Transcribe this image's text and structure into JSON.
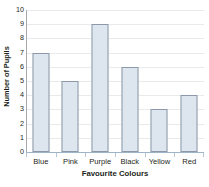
{
  "chart_data": {
    "type": "bar",
    "title": "",
    "xlabel": "Favourite Colours",
    "ylabel": "Number of Pupils",
    "categories": [
      "Blue",
      "Pink",
      "Purple",
      "Black",
      "Yellow",
      "Red"
    ],
    "values": [
      7,
      5,
      9,
      6,
      3,
      4
    ],
    "ylim": [
      0,
      10
    ],
    "yticks": [
      0,
      1,
      2,
      3,
      4,
      5,
      6,
      7,
      8,
      9,
      10
    ],
    "ytick_labels": [
      "0",
      "1",
      "2",
      "3",
      "4",
      "5",
      "6",
      "7",
      "8",
      "9",
      "10"
    ],
    "grid": "horizontal",
    "legend": "none",
    "bar_fill_color": "#dde6ee",
    "bar_border_color": "#8b99a8",
    "gridline_color": "#e9eaec",
    "axis_color": "#9fb4c8",
    "background_color": "#ffffff",
    "text_color": "#231f20"
  }
}
